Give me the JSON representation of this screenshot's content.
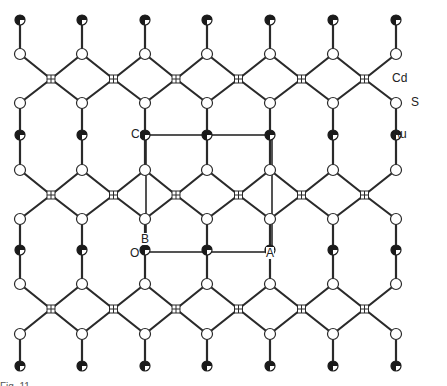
{
  "figure": {
    "legend": [
      {
        "element": "Cd",
        "symbol": "cd-hatched-cross",
        "x": 392,
        "y": 72
      },
      {
        "element": "S",
        "symbol": "open-circle",
        "x": 411,
        "y": 96
      },
      {
        "element": "Au",
        "symbol": "half-filled-circle",
        "x": 392,
        "y": 128
      }
    ],
    "unit_cell": {
      "labels": [
        {
          "text": "C",
          "x": 131,
          "y": 128
        },
        {
          "text": "B",
          "x": 141,
          "y": 233
        },
        {
          "text": "O",
          "x": 130,
          "y": 247
        },
        {
          "text": "A",
          "x": 266,
          "y": 247
        }
      ],
      "rect": {
        "x1": 146,
        "y1": 135,
        "x2": 272,
        "y2": 252
      }
    },
    "lattice": {
      "columns": [
        20,
        82,
        145,
        207,
        270,
        333,
        396
      ],
      "bands": [
        {
          "au_y": 20,
          "s_top_y": 54,
          "cd_y": 79,
          "s_bottom_y": 103
        },
        {
          "au_y": 135,
          "s_top_y": 170,
          "cd_y": 195,
          "s_bottom_y": 219
        },
        {
          "au_y": 250,
          "s_top_y": 284,
          "cd_y": 309,
          "s_bottom_y": 334
        }
      ],
      "bottom_au_y": 366
    },
    "colors": {
      "line": "#2a2a2a",
      "atom_fill": "#ffffff",
      "atom_dark": "#1a1a1a",
      "background": "#ffffff"
    },
    "caption": "Fig. 11. ..."
  }
}
